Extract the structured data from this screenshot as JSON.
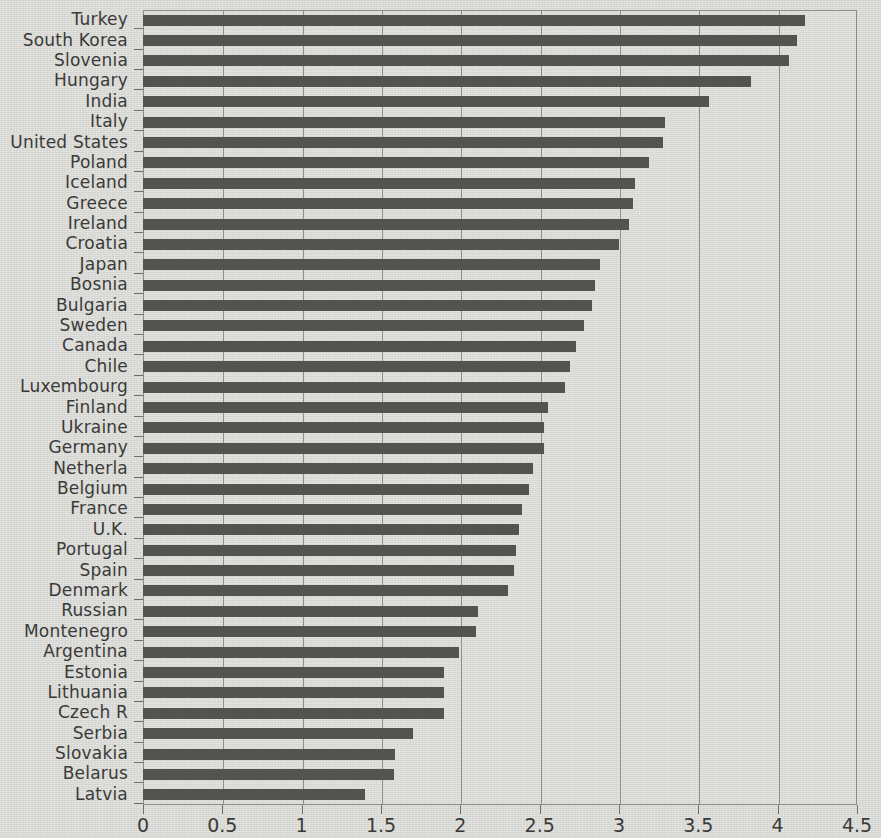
{
  "chart_data": {
    "type": "bar",
    "orientation": "horizontal",
    "title": "",
    "subtitle": "",
    "xlabel": "",
    "ylabel": "",
    "xlim": [
      0,
      4.5
    ],
    "ylim": null,
    "grid": true,
    "grid_axis": "x",
    "legend": null,
    "legend_position": "none",
    "bar_color": "#535350",
    "axis_color": "#8a8a86",
    "background_color": "#d8d8d4",
    "xticks": [
      0,
      0.5,
      1,
      1.5,
      2,
      2.5,
      3,
      3.5,
      4,
      4.5
    ],
    "xtick_labels": [
      "0",
      "0.5",
      "1",
      "1.5",
      "2",
      "2.5",
      "3",
      "3.5",
      "4",
      "4.5"
    ],
    "categories": [
      "Turkey",
      "South Korea",
      "Slovenia",
      "Hungary",
      "India",
      "Italy",
      "United States",
      "Poland",
      "Iceland",
      "Greece",
      "Ireland",
      "Croatia",
      "Japan",
      "Bosnia",
      "Bulgaria",
      "Sweden",
      "Canada",
      "Chile",
      "Luxembourg",
      "Finland",
      "Ukraine",
      "Germany",
      "Netherla",
      "Belgium",
      "France",
      "U.K.",
      "Portugal",
      "Spain",
      "Denmark",
      "Russian",
      "Montenegro",
      "Argentina",
      "Estonia",
      "Lithuania",
      "Czech R",
      "Serbia",
      "Slovakia",
      "Belarus",
      "Latvia"
    ],
    "values": [
      4.17,
      4.12,
      4.07,
      3.83,
      3.57,
      3.29,
      3.28,
      3.19,
      3.1,
      3.09,
      3.06,
      3.0,
      2.88,
      2.85,
      2.83,
      2.78,
      2.73,
      2.69,
      2.66,
      2.55,
      2.53,
      2.53,
      2.46,
      2.43,
      2.39,
      2.37,
      2.35,
      2.34,
      2.3,
      2.11,
      2.1,
      1.99,
      1.9,
      1.9,
      1.9,
      1.7,
      1.59,
      1.58,
      1.4
    ]
  }
}
